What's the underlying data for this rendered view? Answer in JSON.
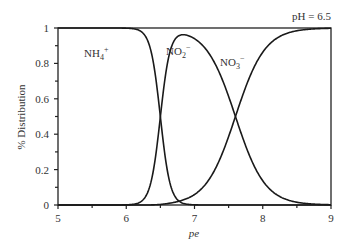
{
  "chart_data": {
    "type": "line",
    "title": "",
    "annotation": "pH = 6.5",
    "xlabel": "pe",
    "ylabel": "% Distribution",
    "xlim": [
      5,
      9
    ],
    "ylim": [
      0,
      1
    ],
    "xticks": [
      "5",
      "6",
      "7",
      "8",
      "9"
    ],
    "yticks": [
      "0",
      "0.2",
      "0.4",
      "0.6",
      "0.8",
      "1"
    ],
    "grid": false,
    "legend": "inline labels",
    "x": [
      5.0,
      5.5,
      6.0,
      6.2,
      6.3,
      6.4,
      6.5,
      6.6,
      6.7,
      6.8,
      6.9,
      7.0,
      7.2,
      7.4,
      7.6,
      7.8,
      8.0,
      8.2,
      8.5,
      9.0
    ],
    "series": [
      {
        "name": "NH4+",
        "label_main": "NH",
        "label_sub": "4",
        "label_sup": "+",
        "values": [
          1.0,
          1.0,
          0.99,
          0.95,
          0.88,
          0.72,
          0.5,
          0.27,
          0.12,
          0.04,
          0.01,
          0.0,
          0.0,
          0.0,
          0.0,
          0.0,
          0.0,
          0.0,
          0.0,
          0.0
        ]
      },
      {
        "name": "NO2-",
        "label_main": "NO",
        "label_sub": "2",
        "label_sup": "−",
        "values": [
          0.0,
          0.0,
          0.01,
          0.05,
          0.12,
          0.28,
          0.5,
          0.72,
          0.86,
          0.94,
          0.95,
          0.93,
          0.85,
          0.7,
          0.5,
          0.3,
          0.15,
          0.07,
          0.02,
          0.0
        ]
      },
      {
        "name": "NO3-",
        "label_main": "NO",
        "label_sub": "3",
        "label_sup": "−",
        "values": [
          0.0,
          0.0,
          0.0,
          0.0,
          0.0,
          0.0,
          0.0,
          0.01,
          0.02,
          0.02,
          0.04,
          0.07,
          0.15,
          0.3,
          0.5,
          0.7,
          0.85,
          0.93,
          0.98,
          1.0
        ]
      }
    ]
  }
}
